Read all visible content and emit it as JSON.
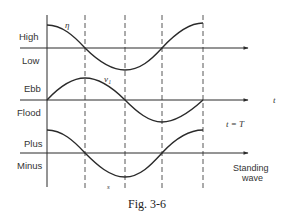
{
  "figure": {
    "caption": "Fig. 3-6",
    "panels": [
      {
        "id": "elevation",
        "symbol": "η",
        "upper_label": "High",
        "lower_label": "Low"
      },
      {
        "id": "current",
        "symbol": "v₁",
        "upper_label": "Ebb",
        "lower_label": "Flood",
        "axis_symbol": "t"
      },
      {
        "id": "surface-slope",
        "symbol": "s",
        "upper_label": "Plus",
        "lower_label": "Minus"
      }
    ],
    "annotations": {
      "period": "t = T",
      "wave_type_line1": "Standing",
      "wave_type_line2": "wave"
    },
    "colors": {
      "stroke": "#2a2a2a",
      "text": "#333333",
      "background": "#ffffff"
    }
  }
}
